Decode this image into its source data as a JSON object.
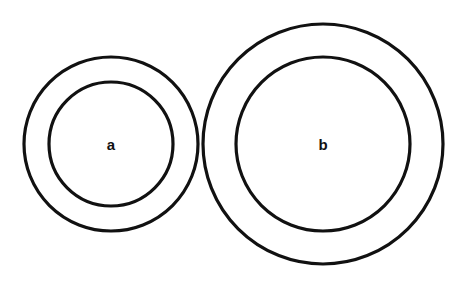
{
  "diagram": {
    "type": "concentric-circles",
    "stroke_color": "#111111",
    "background": "#ffffff",
    "figures": [
      {
        "label": "a",
        "center": [
          111,
          144
        ],
        "outer_radius": 87,
        "inner_radius": 62
      },
      {
        "label": "b",
        "center": [
          323,
          144
        ],
        "outer_radius": 120,
        "inner_radius": 87
      }
    ]
  }
}
